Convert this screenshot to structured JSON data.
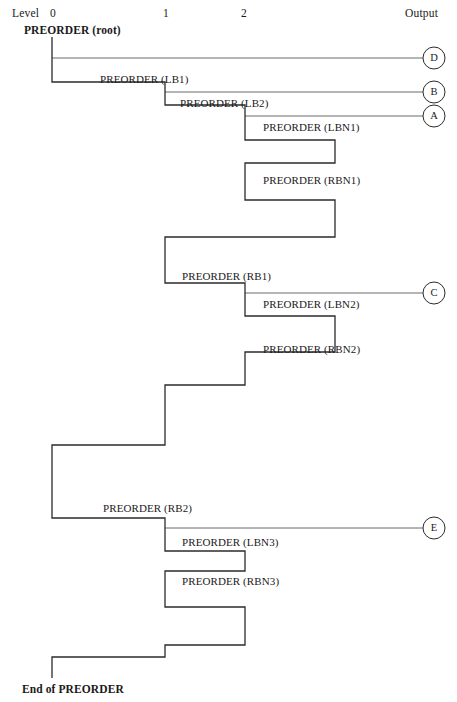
{
  "header": {
    "level_label": "Level",
    "level_ticks": [
      {
        "label": "0",
        "x": 50
      },
      {
        "label": "1",
        "x": 163
      },
      {
        "label": "2",
        "x": 241
      }
    ],
    "output_label": "Output"
  },
  "root_call": "PREORDER (root)",
  "end_label": "End of PREORDER",
  "calls": [
    {
      "name": "PREORDER (LB1)",
      "label_x": 100,
      "label_y": 74
    },
    {
      "name": "PREORDER (LB2)",
      "label_x": 180,
      "label_y": 98
    },
    {
      "name": "PREORDER (LBN1)",
      "label_x": 263,
      "label_y": 122
    },
    {
      "name": "PREORDER (RBN1)",
      "label_x": 263,
      "label_y": 175
    },
    {
      "name": "PREORDER (RB1)",
      "label_x": 182,
      "label_y": 271
    },
    {
      "name": "PREORDER (LBN2)",
      "label_x": 263,
      "label_y": 299
    },
    {
      "name": "PREORDER (RBN2)",
      "label_x": 263,
      "label_y": 344
    },
    {
      "name": "PREORDER (RB2)",
      "label_x": 103,
      "label_y": 503
    },
    {
      "name": "PREORDER (LBN3)",
      "label_x": 182,
      "label_y": 537
    },
    {
      "name": "PREORDER (RBN3)",
      "label_x": 182,
      "label_y": 576
    }
  ],
  "outputs": [
    {
      "letter": "D",
      "cy": 58,
      "from_x": 52,
      "cx": 434,
      "r": 11
    },
    {
      "letter": "B",
      "cy": 92,
      "from_x": 165,
      "cx": 434,
      "r": 11
    },
    {
      "letter": "A",
      "cy": 116,
      "from_x": 245,
      "cx": 434,
      "r": 11
    },
    {
      "letter": "C",
      "cy": 293,
      "from_x": 245,
      "cx": 434,
      "r": 11
    },
    {
      "letter": "E",
      "cy": 528,
      "from_x": 165,
      "cx": 434,
      "r": 11
    }
  ],
  "trace_path": "M 52 37 L 52 82 L 165 82 L 165 105 L 245 105 L 245 140 L 335 140 L 335 163 L 245 163 L 245 200 L 335 200 L 335 237 L 245 237 L 165 237 L 165 283 L 245 283 L 245 316 L 335 316 L 335 352 L 245 352 L 245 385 L 165 385 L 165 445 L 52 445 L 52 518 L 165 518 L 165 551 L 245 551 L 245 571 L 165 571 L 165 607 L 245 607 L 245 645 L 165 645 L 165 657 L 52 657 L 52 678",
  "style": {
    "line_color": "#2b2b2b",
    "line_width": 1.3,
    "output_line_color": "#5a5a5a",
    "output_line_width": 0.9,
    "circle_stroke": "#2b2b2b",
    "background": "#ffffff"
  }
}
